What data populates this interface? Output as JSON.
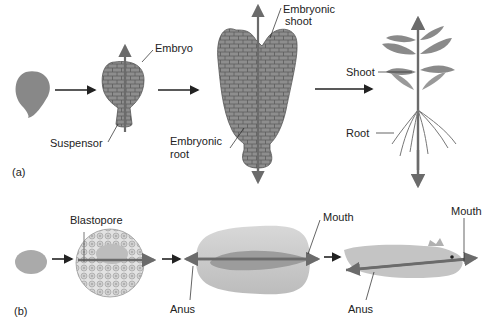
{
  "panels": {
    "a": {
      "tag": "(a)",
      "labels": {
        "embryo": "Embryo",
        "suspensor": "Suspensor",
        "embryonic_shoot_1": "Embryonic",
        "embryonic_shoot_2": "shoot",
        "embryonic_root_1": "Embryonic",
        "embryonic_root_2": "root",
        "shoot": "Shoot",
        "root": "Root"
      }
    },
    "b": {
      "tag": "(b)",
      "labels": {
        "blastopore": "Blastopore",
        "anus_1": "Anus",
        "mouth_1": "Mouth",
        "anus_2": "Anus",
        "mouth_2": "Mouth"
      }
    }
  },
  "colors": {
    "cell_fill": "#8c8c8c",
    "cell_stroke": "#5a5a5a",
    "axis_arrow": "#6b6b6b",
    "light_body": "#d9d9d9",
    "text": "#222222"
  }
}
